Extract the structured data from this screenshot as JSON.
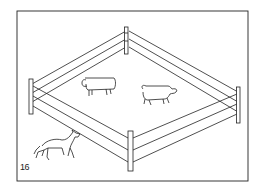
{
  "figure": {
    "number": "16",
    "colors": {
      "ink": "#222222",
      "paper": "#ffffff"
    },
    "elements": [
      "frame",
      "fence-posts",
      "fence-rails",
      "sheep-left",
      "sheep-right",
      "wolf"
    ]
  }
}
